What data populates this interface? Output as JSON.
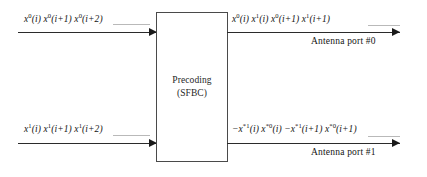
{
  "diagram": {
    "block": {
      "line1": "Precoding",
      "line2": "(SFBC)"
    },
    "inputs": [
      {
        "id": "input-stream-0",
        "label_html": "x<sup>0</sup>(i) x<sup>0</sup>(i+1) x<sup>0</sup>(i+2)",
        "label_text": "x0(i) x0(i+1) x0(i+2)"
      },
      {
        "id": "input-stream-1",
        "label_html": "x<sup>1</sup>(i) x<sup>1</sup>(i+1) x<sup>1</sup>(i+2)",
        "label_text": "x1(i) x1(i+1) x1(i+2)"
      }
    ],
    "outputs": [
      {
        "id": "output-port-0",
        "label_html": "x<sup>0</sup>(i) x<sup>1</sup>(i) x<sup>0</sup>(i+1) x<sup>1</sup>(i+1)",
        "label_text": "x0(i) x1(i) x0(i+1) x1(i+1)",
        "port": "Antenna port #0"
      },
      {
        "id": "output-port-1",
        "label_html": "−x<sup>*1</sup>(i) x<sup>*0</sup>(i) −x<sup>*1</sup>(i+1) x<sup>*0</sup>(i+1)",
        "label_text": "-x*1(i) x*0(i) -x*1(i+1) x*0(i+1)",
        "port": "Antenna port #1"
      }
    ],
    "colors": {
      "line": "#2b2b2b",
      "dash": "#b9b9b9",
      "box_border": "#4a4a4a",
      "text": "#141414",
      "background": "#ffffff"
    }
  }
}
